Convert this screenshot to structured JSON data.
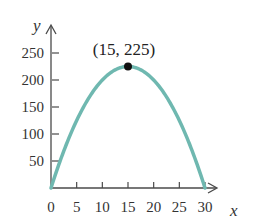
{
  "chart_data": {
    "type": "line",
    "title": "",
    "xlabel": "x",
    "ylabel": "y",
    "xlim": [
      0,
      32
    ],
    "ylim": [
      0,
      275
    ],
    "x_ticks": [
      0,
      5,
      10,
      15,
      20,
      25,
      30
    ],
    "y_ticks": [
      50,
      100,
      150,
      200,
      250
    ],
    "x_tick_labels": [
      "0",
      "5",
      "10",
      "15",
      "20",
      "25",
      "30"
    ],
    "y_tick_labels": [
      "50",
      "100",
      "150",
      "200",
      "250"
    ],
    "grid": false,
    "legend": null,
    "series": [
      {
        "name": "parabola",
        "equation": "y = x(30 - x)",
        "color": "#6fb8b0",
        "x": [
          0,
          2.5,
          5,
          7.5,
          10,
          12.5,
          15,
          17.5,
          20,
          22.5,
          25,
          27.5,
          30
        ],
        "y": [
          0,
          68.75,
          125,
          168.75,
          200,
          218.75,
          225,
          218.75,
          200,
          168.75,
          125,
          68.75,
          0
        ]
      }
    ],
    "annotations": [
      {
        "text": "(15, 225)",
        "x": 15,
        "y": 225,
        "marker": "filled-circle",
        "marker_color": "#111111"
      }
    ]
  },
  "labels": {
    "x_axis": "x",
    "y_axis": "y",
    "vertex": "(15, 225)"
  }
}
